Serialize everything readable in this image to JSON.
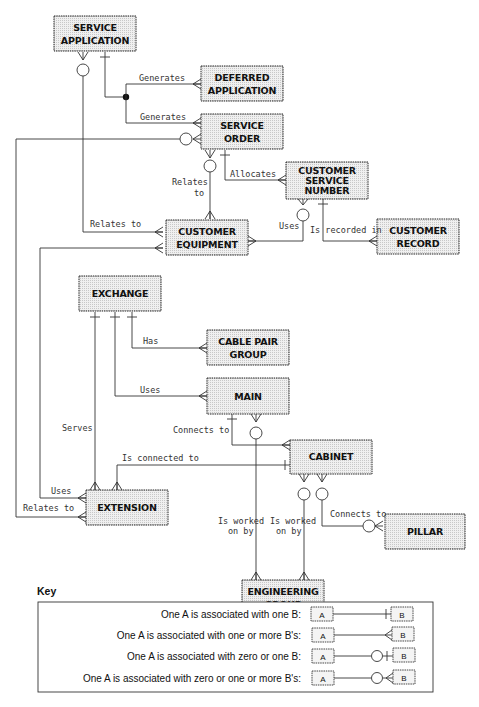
{
  "entities": {
    "service_application": {
      "line1": "SERVICE",
      "line2": "APPLICATION"
    },
    "deferred_application": {
      "line1": "DEFERRED",
      "line2": "APPLICATION"
    },
    "service_order": {
      "line1": "SERVICE",
      "line2": "ORDER"
    },
    "customer_service_number": {
      "line1": "CUSTOMER",
      "line2": "SERVICE",
      "line3": "NUMBER"
    },
    "customer_equipment": {
      "line1": "CUSTOMER",
      "line2": "EQUIPMENT"
    },
    "customer_record": {
      "line1": "CUSTOMER",
      "line2": "RECORD"
    },
    "exchange": {
      "line1": "EXCHANGE"
    },
    "cable_pair_group": {
      "line1": "CABLE PAIR",
      "line2": "GROUP"
    },
    "main": {
      "line1": "MAIN"
    },
    "cabinet": {
      "line1": "CABINET"
    },
    "extension": {
      "line1": "EXTENSION"
    },
    "pillar": {
      "line1": "PILLAR"
    },
    "engineering_group": {
      "line1": "ENGINEERING",
      "line2": "GROUP"
    }
  },
  "relationships": {
    "generates_deferred": "Generates",
    "generates_order": "Generates",
    "relates_to_order_equipment_1": "Relates",
    "relates_to_order_equipment_2": "to",
    "allocates": "Allocates",
    "uses_number": "Uses",
    "is_recorded_in": "Is recorded in",
    "relates_to_application_equipment": "Relates to",
    "has": "Has",
    "uses_main": "Uses",
    "serves": "Serves",
    "connects_to_main_cabinet": "Connects to",
    "is_connected_to": "Is connected to",
    "uses_extension": "Uses",
    "relates_to_extension": "Relates to",
    "is_worked_on_by_1a": "Is worked",
    "is_worked_on_by_1b": "on by",
    "is_worked_on_by_2a": "Is worked",
    "is_worked_on_by_2b": "on by",
    "connects_to_pillar": "Connects to"
  },
  "key": {
    "title": "Key",
    "rows": [
      {
        "text": "One A is associated with one B:",
        "a": "A",
        "b": "B",
        "type": "one-to-one"
      },
      {
        "text": "One A is associated with one or more B's:",
        "a": "A",
        "b": "B",
        "type": "one-to-many"
      },
      {
        "text": "One A is associated with zero or one B:",
        "a": "A",
        "b": "B",
        "type": "zero-or-one"
      },
      {
        "text": "One A is associated with zero or one or more B's:",
        "a": "A",
        "b": "B",
        "type": "zero-or-many"
      }
    ]
  }
}
